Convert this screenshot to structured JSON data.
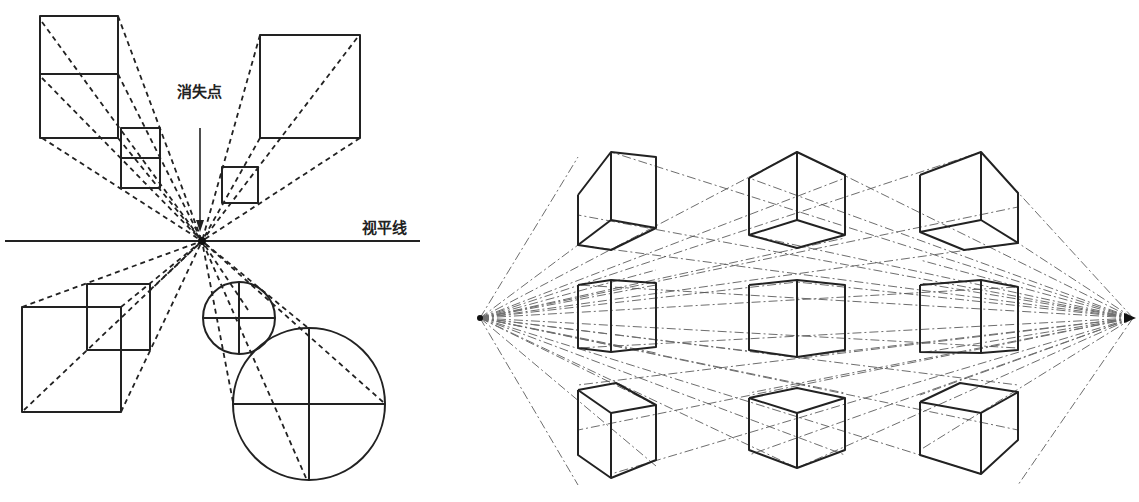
{
  "figure": {
    "left_panel": {
      "title": "One-point perspective: shapes converging to a single vanishing point",
      "vanishing_point_label": "消失点",
      "horizon_label": "视平线",
      "vanishing_point": [
        202,
        241
      ],
      "horizon": {
        "x1": 5,
        "x2": 420,
        "y": 241
      },
      "arrow": {
        "x": 200,
        "y1": 128,
        "y2": 230
      },
      "shapes": [
        {
          "id": "top-left-rect-pair",
          "type": "rect-pair",
          "far": [
            121,
            128,
            160,
            188,
            158
          ],
          "near": [
            40,
            16,
            118,
            138,
            74
          ]
        },
        {
          "id": "top-right-square",
          "type": "square",
          "far": [
            222,
            167,
            258,
            203
          ],
          "near": [
            260,
            35,
            360,
            138
          ]
        },
        {
          "id": "bottom-left-square",
          "type": "square",
          "far": [
            87,
            284,
            150,
            350
          ],
          "near": [
            22,
            307,
            121,
            412
          ]
        },
        {
          "id": "circles",
          "type": "circle",
          "far": {
            "cx": 239,
            "cy": 318,
            "r": 36
          },
          "near": {
            "cx": 309,
            "cy": 404,
            "r": 76
          }
        }
      ]
    },
    "right_panel": {
      "title": "Two-point perspective: 3×3 grid of cubes",
      "left_vanishing_point": [
        480,
        318
      ],
      "right_vanishing_point": [
        1133,
        318
      ],
      "cube_rows": [
        "above-horizon",
        "on-horizon",
        "below-horizon"
      ],
      "cube_cols": [
        "left",
        "center",
        "right"
      ],
      "cube_count": 9
    }
  }
}
